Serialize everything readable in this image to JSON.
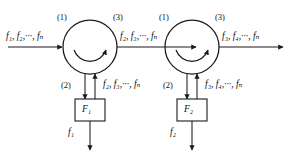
{
  "figure": {
    "type": "signal-flow-diagram",
    "background_color": "#ffffff",
    "line_color": "#1a1a1a"
  },
  "stages": [
    {
      "id": "stage-1",
      "node_label_in": "(1)",
      "node_label_out": "(3)",
      "node_label_down": "(2)",
      "input_signal": "f₁, f₂,···, fₙ",
      "output_signal": "f₂, f₃,···, fₙ",
      "reflected_signal": "f₂, f₃,···, fₙ",
      "filter_label": "F₁",
      "dropped_signal": "f₁"
    },
    {
      "id": "stage-2",
      "node_label_in": "(1)",
      "node_label_out": "(3)",
      "node_label_down": "(2)",
      "input_signal": "f₂, f₃,···, fₙ",
      "output_signal": "f₃, f₄,···, fₙ",
      "reflected_signal": "f₃, f₄,···, fₙ",
      "filter_label": "F₂",
      "dropped_signal": "f₂"
    }
  ],
  "icons": {
    "circulator": "circulator-arc-icon",
    "arrowhead": "arrowhead-icon"
  }
}
